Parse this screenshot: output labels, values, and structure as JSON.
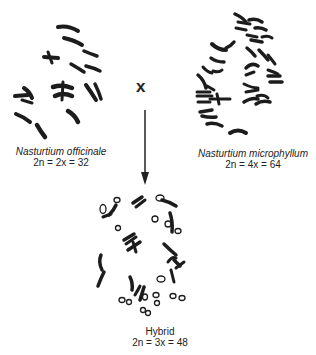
{
  "figure": {
    "parent_left": {
      "species": "Nasturtium officinale",
      "formula": "2n = 2x = 32"
    },
    "parent_right": {
      "species": "Nasturtium microphyllum",
      "formula": "2n = 4x = 64"
    },
    "cross_symbol": "x",
    "offspring": {
      "label": "Hybrid",
      "formula": "2n = 3x = 48"
    },
    "colors": {
      "chromosome": "#1c1c1c",
      "background": "#ffffff"
    }
  }
}
